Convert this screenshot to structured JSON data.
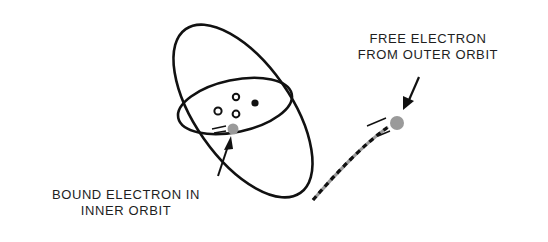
{
  "diagram": {
    "labels": {
      "free_electron": [
        "FREE ELECTRON",
        "FROM OUTER ORBIT"
      ],
      "bound_electron": [
        "BOUND ELECTRON IN",
        "INNER ORBIT"
      ]
    },
    "elements": {
      "outer_orbit": "large tilted elliptical orbit",
      "inner_orbit": "small flat elliptical orbit",
      "nucleus_particles": 4,
      "bound_electron": "gray dot on inner orbit",
      "free_electron": "gray dot leaving along dashed trajectory"
    },
    "colors": {
      "line": "#111111",
      "electron": "#9a9a9a",
      "text": "#1e1e1e",
      "background": "#ffffff"
    }
  }
}
